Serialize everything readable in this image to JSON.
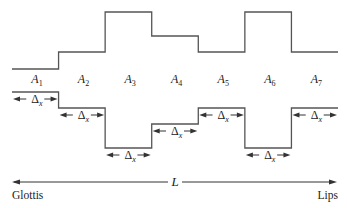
{
  "diagram": {
    "sections": [
      {
        "label": "A",
        "sub": "1",
        "top": 69,
        "bottom": 92
      },
      {
        "label": "A",
        "sub": "2",
        "top": 52,
        "bottom": 108
      },
      {
        "label": "A",
        "sub": "3",
        "top": 12,
        "bottom": 148
      },
      {
        "label": "A",
        "sub": "4",
        "top": 36,
        "bottom": 124
      },
      {
        "label": "A",
        "sub": "5",
        "top": 52,
        "bottom": 108
      },
      {
        "label": "A",
        "sub": "6",
        "top": 12,
        "bottom": 148
      },
      {
        "label": "A",
        "sub": "7",
        "top": 52,
        "bottom": 108
      }
    ],
    "section_length_label": "Δ",
    "section_length_sub": "x",
    "total_length_label": "L",
    "left_end_label": "Glottis",
    "right_end_label": "Lips",
    "colors": {
      "line": "#555555",
      "text": "#222222"
    }
  }
}
